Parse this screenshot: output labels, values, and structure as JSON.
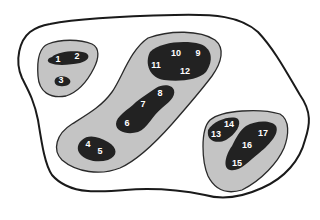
{
  "diagram": {
    "type": "nested-cluster-diagram",
    "colors": {
      "outer_fill": "#ffffff",
      "outer_stroke": "#1a1a1a",
      "cluster_fill": "#c4c4c4",
      "core_fill": "#222222",
      "label_color": "#ffffff"
    },
    "clusters": [
      {
        "name": "top-left",
        "cores": [
          {
            "labels": [
              "1",
              "2"
            ]
          },
          {
            "labels": [
              "3"
            ]
          }
        ]
      },
      {
        "name": "center",
        "cores": [
          {
            "labels": [
              "9",
              "10",
              "11",
              "12"
            ]
          },
          {
            "labels": [
              "6",
              "7",
              "8"
            ]
          },
          {
            "labels": [
              "4",
              "5"
            ]
          }
        ]
      },
      {
        "name": "right",
        "cores": [
          {
            "labels": [
              "13",
              "14"
            ]
          },
          {
            "labels": [
              "15",
              "16",
              "17"
            ]
          }
        ]
      }
    ],
    "nodes": {
      "n1": "1",
      "n2": "2",
      "n3": "3",
      "n4": "4",
      "n5": "5",
      "n6": "6",
      "n7": "7",
      "n8": "8",
      "n9": "9",
      "n10": "10",
      "n11": "11",
      "n12": "12",
      "n13": "13",
      "n14": "14",
      "n15": "15",
      "n16": "16",
      "n17": "17"
    }
  }
}
